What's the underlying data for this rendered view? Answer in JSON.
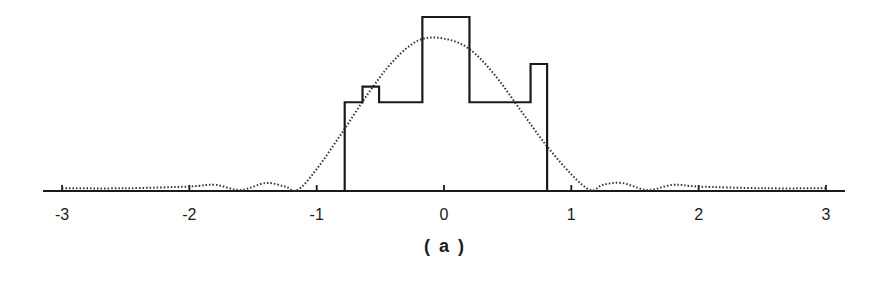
{
  "chart_data": {
    "type": "line",
    "title": "",
    "caption": "( a )",
    "xlabel": "",
    "ylabel": "",
    "xlim": [
      -3.15,
      3.15
    ],
    "x_ticks": [
      -3,
      -2,
      -1,
      0,
      1,
      2,
      3
    ],
    "x_tick_labels": [
      "-3",
      "-2",
      "-1",
      "0",
      "1",
      "2",
      "3"
    ],
    "grid": false,
    "legend": null,
    "series": [
      {
        "name": "step-profile",
        "style": "solid",
        "color": "#1a1a1a",
        "x_edges": [
          -0.78,
          -0.64,
          -0.51,
          -0.17,
          0.2,
          0.68,
          0.81
        ],
        "heights": [
          0.51,
          0.6,
          0.51,
          1.0,
          0.51,
          0.73
        ],
        "note": "piecewise-constant histogram-like profile, zero outside [-0.78, 0.81]"
      },
      {
        "name": "smooth-fit",
        "style": "dotted",
        "color": "#333333",
        "x": [
          -3.0,
          -2.5,
          -2.0,
          -1.8,
          -1.6,
          -1.4,
          -1.25,
          -1.15,
          -1.0,
          -0.8,
          -0.6,
          -0.4,
          -0.2,
          0.0,
          0.2,
          0.4,
          0.6,
          0.8,
          1.0,
          1.15,
          1.25,
          1.4,
          1.6,
          1.8,
          2.0,
          2.5,
          3.0
        ],
        "y": [
          0.01,
          0.01,
          0.02,
          0.03,
          0.0,
          0.04,
          0.02,
          0.0,
          0.12,
          0.33,
          0.55,
          0.74,
          0.86,
          0.87,
          0.81,
          0.66,
          0.46,
          0.26,
          0.09,
          0.0,
          0.03,
          0.04,
          0.0,
          0.03,
          0.02,
          0.01,
          0.01
        ]
      }
    ]
  }
}
